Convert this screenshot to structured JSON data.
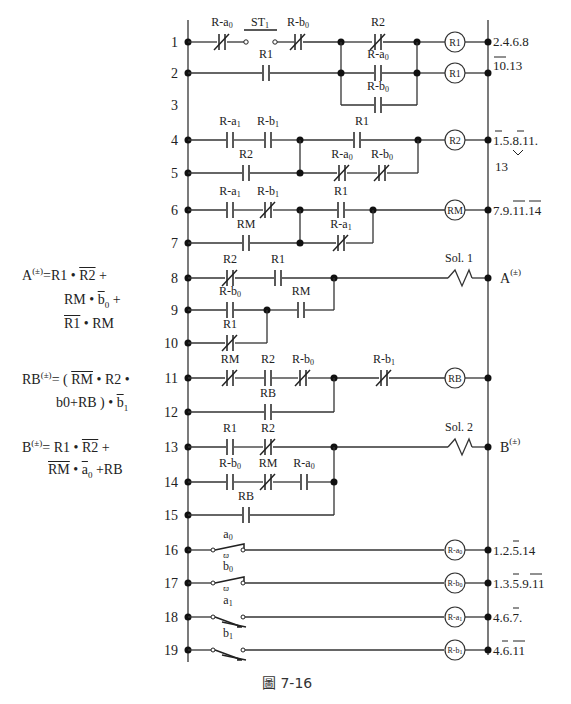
{
  "figure": {
    "caption": "圖 7-16",
    "caption_mark": "圖",
    "caption_number": "7-16"
  },
  "rungs": [
    {
      "n": "1",
      "contacts": [
        "R-a0 (NC)",
        "ST1 (push-button NO)",
        "R-b0 (NC)",
        "R2 (NC)"
      ],
      "output": "R1",
      "refs": "2.4.6.8 / 10.13"
    },
    {
      "n": "2",
      "contacts": [
        "R1 (NO)",
        "R-a0 (NO)"
      ],
      "output": "R1",
      "refs": ""
    },
    {
      "n": "3",
      "contacts": [
        "R-b0 (NO)"
      ],
      "output": "",
      "refs": ""
    },
    {
      "n": "4",
      "contacts": [
        "R-a1 (NO)",
        "R-b1 (NO)",
        "R1 (NO)"
      ],
      "output": "R2",
      "refs": "1.5.8.11. 13"
    },
    {
      "n": "5",
      "contacts": [
        "R2 (NO)",
        "R-a0 (NC)",
        "R-b0 (NC)"
      ],
      "output": "",
      "refs": ""
    },
    {
      "n": "6",
      "contacts": [
        "R-a1 (NO)",
        "R-b1 (NC)",
        "R1 (NO)"
      ],
      "output": "RM",
      "refs": "7.9.11.14"
    },
    {
      "n": "7",
      "contacts": [
        "RM (NO)",
        "R-a1 (NC)"
      ],
      "output": "",
      "refs": ""
    },
    {
      "n": "8",
      "contacts": [
        "R2 (NC)",
        "R1 (NO)"
      ],
      "output": "Sol. 1",
      "refs": "A(±)"
    },
    {
      "n": "9",
      "contacts": [
        "R-b0 (NO)",
        "RM (NO)"
      ],
      "output": "",
      "refs": ""
    },
    {
      "n": "10",
      "contacts": [
        "R1 (NC)"
      ],
      "output": "",
      "refs": ""
    },
    {
      "n": "11",
      "contacts": [
        "RM (NC)",
        "R2 (NO)",
        "R-b0 (NC)",
        "R-b1 (NC)"
      ],
      "output": "RB",
      "refs": ""
    },
    {
      "n": "12",
      "contacts": [
        "RB (NO)"
      ],
      "output": "",
      "refs": ""
    },
    {
      "n": "13",
      "contacts": [
        "R1 (NO)",
        "R2 (NC)"
      ],
      "output": "Sol. 2",
      "refs": "B(±)"
    },
    {
      "n": "14",
      "contacts": [
        "R-b0 (NO)",
        "RM (NC)",
        "R-a0 (NO)"
      ],
      "output": "",
      "refs": ""
    },
    {
      "n": "15",
      "contacts": [
        "RB (NO)"
      ],
      "output": "",
      "refs": ""
    },
    {
      "n": "16",
      "contacts": [
        "a0 (limit switch)"
      ],
      "output": "R-a0",
      "refs": "1.2.5.14"
    },
    {
      "n": "17",
      "contacts": [
        "b0 (limit switch)"
      ],
      "output": "R-b0",
      "refs": "1.3.5.9.11"
    },
    {
      "n": "18",
      "contacts": [
        "a1 (limit switch)"
      ],
      "output": "R-a1",
      "refs": "4.6.7."
    },
    {
      "n": "19",
      "contacts": [
        "b1 (limit switch)"
      ],
      "output": "R-b1",
      "refs": "4.6.11"
    }
  ],
  "labels": {
    "r1_a0": "R-a",
    "r1_st1": "ST",
    "r1_b0": "R-b",
    "r1_r2": "R2",
    "r2_r1": "R1",
    "r2_a0": "R-a",
    "r3_b0": "R-b",
    "r4_a1": "R-a",
    "r4_b1": "R-b",
    "r4_r1": "R1",
    "r5_r2": "R2",
    "r5_a0": "R-a",
    "r5_b0": "R-b",
    "r6_a1": "R-a",
    "r6_b1": "R-b",
    "r6_r1": "R1",
    "r7_rm": "RM",
    "r7_a1": "R-a",
    "r8_r2": "R2",
    "r8_r1": "R1",
    "sol1": "Sol. 1",
    "r9_b0": "R-b",
    "r9_rm": "RM",
    "r10_r1": "R1",
    "r11_rm": "RM",
    "r11_r2": "R2",
    "r11_b0": "R-b",
    "r11_b1": "R-b",
    "r12_rb": "RB",
    "r13_r1": "R1",
    "r13_r2": "R2",
    "sol2": "Sol. 2",
    "r14_b0": "R-b",
    "r14_rm": "RM",
    "r14_a0": "R-a",
    "r15_rb": "RB",
    "ls_a0": "a",
    "ls_b0": "b",
    "ls_a1": "a",
    "ls_b1": "b",
    "sub0": "0",
    "sub1": "1"
  },
  "coils": {
    "c1": "R1",
    "c2": "R1",
    "c4": "R2",
    "c6": "RM",
    "c11": "RB",
    "c16": "R-a",
    "c17": "R-b",
    "c18": "R-a",
    "c19": "R-b"
  },
  "refs": {
    "r1_line1": "2.4.6.8",
    "r1_line2": "10.13",
    "r4_line1": "1.5.8.11.",
    "r4_line2": "13",
    "r6": "7.9.11.14",
    "r8": "A",
    "r13": "B",
    "pm": "(±)",
    "r16": "1.2.5.14",
    "r17": "1.3.5.9.11",
    "r18": "4.6.7.",
    "r19": "4.6.11"
  },
  "equations": {
    "A": {
      "lhs": "A",
      "sup": "(±)",
      "line1": [
        "=R1 • ",
        "R2",
        " +"
      ],
      "line2": [
        "RM • ",
        "b",
        "0",
        " +"
      ],
      "line3": [
        "R1",
        " • RM"
      ]
    },
    "RB": {
      "lhs": "RB",
      "sup": "(±)",
      "line1": [
        "= ( ",
        "RM",
        " • R2 •"
      ],
      "line2": [
        "b0+RB ) • ",
        "b",
        "1"
      ]
    },
    "B": {
      "lhs": "B",
      "sup": "(±)",
      "line1": [
        "= R1 • ",
        "R2",
        " +"
      ],
      "line2": [
        "RM",
        " • ",
        "a",
        "0",
        " +RB"
      ]
    }
  }
}
